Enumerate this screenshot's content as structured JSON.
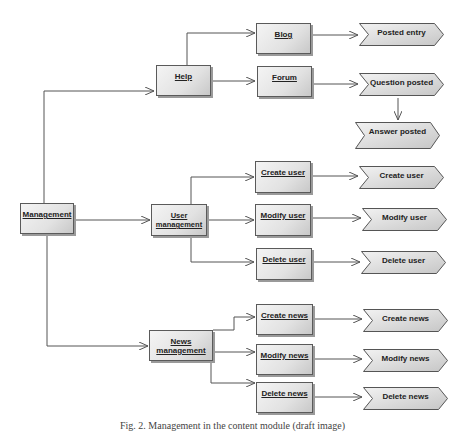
{
  "diagram": {
    "type": "process-hierarchy",
    "root": {
      "label": "Management"
    },
    "functions": {
      "help": {
        "label": "Help"
      },
      "blog": {
        "label": "Blog"
      },
      "forum": {
        "label": "Forum"
      },
      "user_management": {
        "label": "User management"
      },
      "create_user": {
        "label": "Create user"
      },
      "modify_user": {
        "label": "Modify user"
      },
      "delete_user": {
        "label": "Delete user"
      },
      "news_management": {
        "label": "News management"
      },
      "create_news": {
        "label": "Create news"
      },
      "modify_news": {
        "label": "Modify news"
      },
      "delete_news": {
        "label": "Delete news"
      }
    },
    "events": {
      "posted_entry": {
        "label": "Posted entry"
      },
      "question_posted": {
        "label": "Question posted"
      },
      "answer_posted": {
        "label": "Answer posted"
      },
      "create_user": {
        "label": "Create user"
      },
      "modify_user": {
        "label": "Modify user"
      },
      "delete_user": {
        "label": "Delete user"
      },
      "create_news": {
        "label": "Create news"
      },
      "modify_news": {
        "label": "Modify news"
      },
      "delete_news": {
        "label": "Delete news"
      }
    },
    "edges": [
      [
        "Management",
        "Help"
      ],
      [
        "Management",
        "User management"
      ],
      [
        "Management",
        "News management"
      ],
      [
        "Help",
        "Blog"
      ],
      [
        "Help",
        "Forum"
      ],
      [
        "Blog",
        "Posted entry"
      ],
      [
        "Forum",
        "Question posted"
      ],
      [
        "Question posted",
        "Answer posted"
      ],
      [
        "User management",
        "Create user"
      ],
      [
        "User management",
        "Modify user"
      ],
      [
        "User management",
        "Delete user"
      ],
      [
        "Create user",
        "Create user (event)"
      ],
      [
        "Modify user",
        "Modify user (event)"
      ],
      [
        "Delete user",
        "Delete user (event)"
      ],
      [
        "News management",
        "Create news"
      ],
      [
        "News management",
        "Modify news"
      ],
      [
        "News management",
        "Delete news"
      ],
      [
        "Create news",
        "Create news (event)"
      ],
      [
        "Modify news",
        "Modify news (event)"
      ],
      [
        "Delete news",
        "Delete news (event)"
      ]
    ]
  },
  "caption": "Fig. 2. Management in the content module (draft image)"
}
